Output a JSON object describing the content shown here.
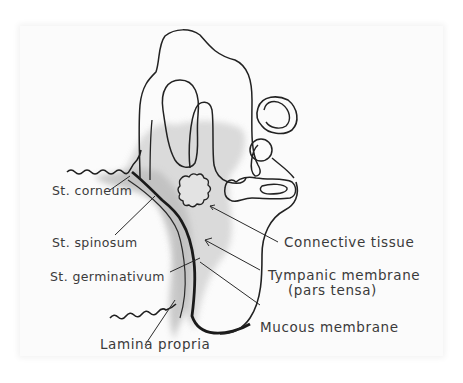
{
  "figure": {
    "labels": {
      "st_corneum": "St. corneum",
      "st_spinosum": "St. spinosum",
      "st_germinativum": "St. germinativum",
      "lamina_propria": "Lamina propria",
      "connective_tissue": "Connective tissue",
      "tympanic_membrane_line1": "Tympanic membrane",
      "tympanic_membrane_line2": "(pars tensa)",
      "mucous_membrane": "Mucous membrane"
    },
    "colors": {
      "ink": "#1e1e1e",
      "shading": "#c9c9c9",
      "paper": "#fbfbfb",
      "label_text": "#3a3a3a"
    }
  }
}
